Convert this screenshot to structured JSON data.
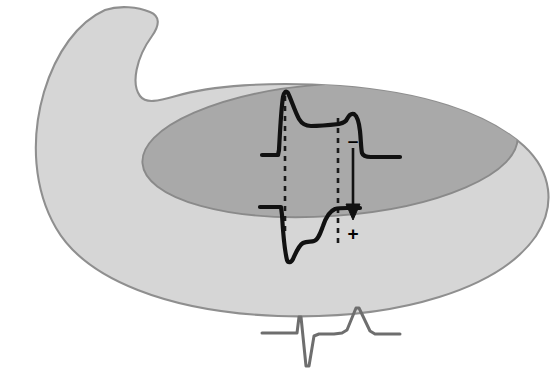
{
  "figure": {
    "name": "ventricular-wall-action-potential-diagram",
    "background_color": "#ffffff"
  },
  "anatomy": {
    "outer_wall": {
      "label": "ventricular-myocardial-wall",
      "fill_color": "#d6d6d6",
      "stroke_color": "#8f8f8f",
      "description": "Light gray crescent-shaped ventricular wall shown in oblique cut-away view with an upward hook at the upper left"
    },
    "inner_cavity": {
      "label": "ventricular-cavity-endocardial-surface",
      "fill_color": "#a9a9a9",
      "stroke_color": "#8a8a8a",
      "description": "Darker gray elliptical inner cavity representing the endocardial surface"
    }
  },
  "traces": {
    "epicardial_action_potential": {
      "label": "Epicardial action potential",
      "morphology": "spike-and-dome",
      "stroke_color": "#111111",
      "stroke_width": 4.2,
      "baseline_y": 155,
      "peak_y": 91,
      "features": [
        "rapid phase 0 upstroke",
        "phase 1 notch",
        "prominent spike-and-dome",
        "long plateau",
        "late secondary dome hump",
        "steep phase 3 repolarization"
      ]
    },
    "endocardial_action_potential": {
      "label": "Endocardial repolarization trace",
      "morphology": "downward-deflection-with-slow-recovery",
      "stroke_color": "#111111",
      "stroke_width": 4.2,
      "baseline_y": 207,
      "trough_y": 262,
      "features": [
        "short flat baseline segment",
        "sharp downward deflection",
        "shallow trough",
        "slow sigmoid recovery",
        "return to plateau"
      ]
    },
    "ecg": {
      "label": "Surface ECG complex",
      "stroke_color": "#6e6e6e",
      "stroke_width": 3.0,
      "baseline_y": 333,
      "components": [
        {
          "name": "R wave",
          "polarity": "positive",
          "peak_y": 316
        },
        {
          "name": "S wave",
          "polarity": "negative",
          "nadir_y": 366
        },
        {
          "name": "T wave",
          "polarity": "positive",
          "peak_y": 308
        }
      ]
    }
  },
  "annotations": {
    "gradient_arrow": {
      "name": "repolarization-gradient-arrow",
      "label": "voltage gradient arrow",
      "direction": "downward",
      "stroke_color": "#111111",
      "from": {
        "x": 353,
        "y": 148
      },
      "to": {
        "x": 353,
        "y": 219
      }
    },
    "negative_sign": {
      "name": "negative-polarity-sign",
      "text": "–",
      "x": 353,
      "y": 143
    },
    "positive_sign": {
      "name": "positive-polarity-sign",
      "text": "+",
      "x": 353,
      "y": 233
    },
    "dashed_lines": [
      {
        "name": "activation-time-reference-line",
        "x": 285,
        "y_top": 96,
        "y_bottom": 236,
        "stroke_color": "#1a1a1a",
        "dash_pattern": "5 5"
      },
      {
        "name": "repolarization-time-reference-line",
        "x": 338,
        "y_top": 118,
        "y_bottom": 248,
        "stroke_color": "#1a1a1a",
        "dash_pattern": "5 5"
      }
    ]
  }
}
